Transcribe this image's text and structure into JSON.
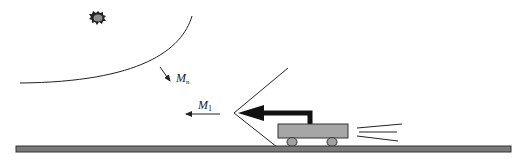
{
  "diagram": {
    "type": "physics-schematic",
    "labels": {
      "mirror_normal": {
        "main": "M",
        "sub": "n"
      },
      "momentum": {
        "main": "M",
        "sub": "1"
      }
    },
    "elements": [
      "light-source (sun/star burst)",
      "curved mirror arc",
      "normal arrow M_n",
      "momentum arrow M_1",
      "V-shaped reflected wave front",
      "thick black bent arrow on cart",
      "cart with two wheels",
      "speed lines behind cart",
      "ground rail"
    ],
    "colors": {
      "ink": "#222222",
      "cart_fill": "#a6a6a6",
      "wheel_fill": "#a0a0a0",
      "rail_fill": "#7a7a7a",
      "source_fill": "#8c8c8c"
    }
  }
}
